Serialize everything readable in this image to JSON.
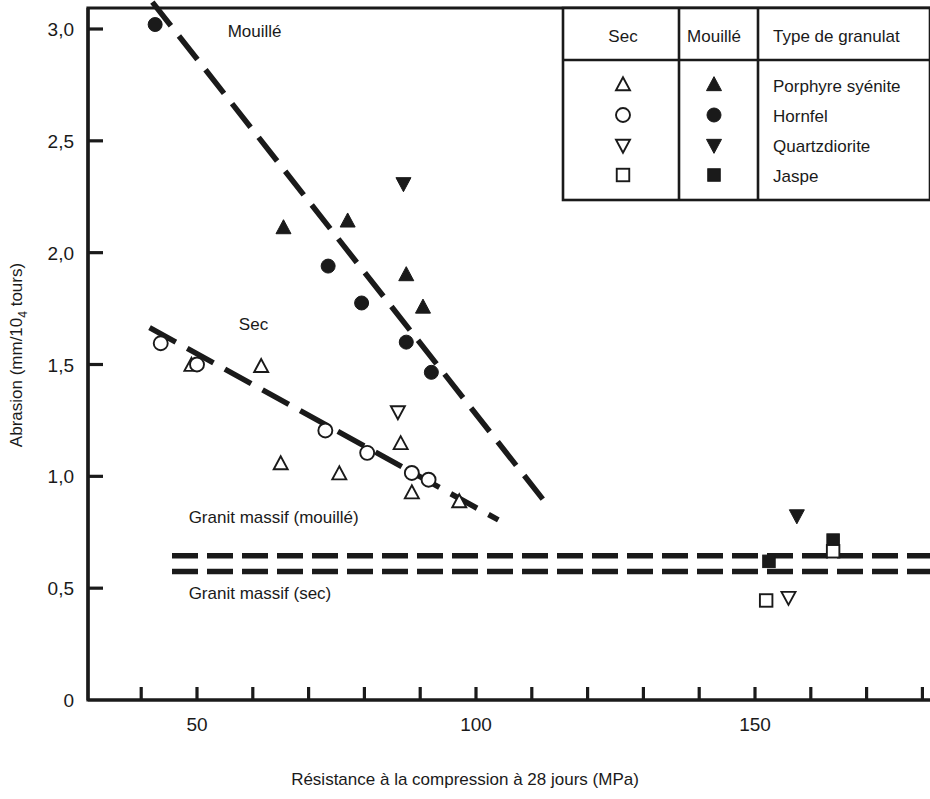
{
  "chart_data": {
    "type": "scatter",
    "title": "",
    "xlabel": "Résistance à la compression à 28 jours (MPa)",
    "ylabel": "Abrasion (mm/10",
    "ylabel_sub": "4",
    "ylabel_tail": " tours)",
    "xlim": [
      30,
      180
    ],
    "ylim": [
      0,
      3.15
    ],
    "x_ticks_major": [
      50,
      100,
      150
    ],
    "x_tick_labels": [
      "50",
      "100",
      "150"
    ],
    "x_ticks_minor": [
      40,
      60,
      70,
      80,
      90,
      110,
      120,
      130,
      140,
      160,
      170,
      180
    ],
    "y_ticks": [
      0,
      0.5,
      1.0,
      1.5,
      2.0,
      2.5,
      3.0
    ],
    "y_tick_labels": [
      "0",
      "0,5",
      "1,0",
      "1,5",
      "2,0",
      "2,5",
      "3,0"
    ],
    "grid": false,
    "legend_position": "top-right",
    "series": [
      {
        "name": "Porphyre syénite (mouillé)",
        "marker": "filled-triangle-up",
        "condition": "mouille",
        "points": [
          {
            "x": 65.5,
            "y": 2.11
          },
          {
            "x": 77.0,
            "y": 2.14
          },
          {
            "x": 87.5,
            "y": 1.9
          },
          {
            "x": 90.5,
            "y": 1.755
          }
        ]
      },
      {
        "name": "Hornfel (mouillé)",
        "marker": "filled-circle",
        "condition": "mouille",
        "points": [
          {
            "x": 42.5,
            "y": 3.02
          },
          {
            "x": 73.5,
            "y": 1.94
          },
          {
            "x": 79.5,
            "y": 1.775
          },
          {
            "x": 87.5,
            "y": 1.6
          },
          {
            "x": 92.0,
            "y": 1.465
          }
        ]
      },
      {
        "name": "Quartzdiorite (mouillé)",
        "marker": "filled-triangle-down",
        "condition": "mouille",
        "points": [
          {
            "x": 87.0,
            "y": 2.31
          },
          {
            "x": 157.5,
            "y": 0.825
          }
        ]
      },
      {
        "name": "Jaspe (mouillé)",
        "marker": "filled-square",
        "condition": "mouille",
        "points": [
          {
            "x": 152.5,
            "y": 0.62
          },
          {
            "x": 164.0,
            "y": 0.715
          }
        ]
      },
      {
        "name": "Porphyre syénite (sec)",
        "marker": "open-triangle-up",
        "condition": "sec",
        "points": [
          {
            "x": 49.0,
            "y": 1.495
          },
          {
            "x": 61.5,
            "y": 1.49
          },
          {
            "x": 65.0,
            "y": 1.055
          },
          {
            "x": 75.5,
            "y": 1.01
          },
          {
            "x": 86.5,
            "y": 1.145
          },
          {
            "x": 88.5,
            "y": 0.925
          },
          {
            "x": 97.0,
            "y": 0.885
          }
        ]
      },
      {
        "name": "Hornfel (sec)",
        "marker": "open-circle",
        "condition": "sec",
        "points": [
          {
            "x": 43.5,
            "y": 1.595
          },
          {
            "x": 50.0,
            "y": 1.5
          },
          {
            "x": 73.0,
            "y": 1.205
          },
          {
            "x": 80.5,
            "y": 1.105
          },
          {
            "x": 88.5,
            "y": 1.015
          },
          {
            "x": 91.5,
            "y": 0.985
          }
        ]
      },
      {
        "name": "Quartzdiorite (sec)",
        "marker": "open-triangle-down",
        "condition": "sec",
        "points": [
          {
            "x": 86.0,
            "y": 1.29
          },
          {
            "x": 156.0,
            "y": 0.46
          }
        ]
      },
      {
        "name": "Jaspe (sec)",
        "marker": "open-square",
        "condition": "sec",
        "points": [
          {
            "x": 152.0,
            "y": 0.445
          },
          {
            "x": 164.0,
            "y": 0.665
          }
        ]
      }
    ],
    "trend_lines": [
      {
        "name": "Mouillé",
        "x1": 42.0,
        "y1": 3.12,
        "x2": 113.0,
        "y2": 0.865,
        "dashed": true
      },
      {
        "name": "Sec",
        "x1": 41.5,
        "y1": 1.665,
        "x2": 104.0,
        "y2": 0.805,
        "dashed": true
      }
    ],
    "reference_lines": [
      {
        "name": "Granit massif (mouillé)",
        "y": 0.645,
        "dashed": true
      },
      {
        "name": "Granit massif (sec)",
        "y": 0.575,
        "dashed": true
      }
    ],
    "annotations": [
      {
        "name": "Mouillé",
        "text": "Mouillé",
        "x": 55.5,
        "y": 2.965
      },
      {
        "name": "Sec",
        "text": "Sec",
        "x": 57.5,
        "y": 1.655
      },
      {
        "name": "Granit massif (mouillé)",
        "text": "Granit massif (mouillé)",
        "x": 48.5,
        "y": 0.79
      },
      {
        "name": "Granit massif (sec)",
        "text": "Granit massif (sec)",
        "x": 48.5,
        "y": 0.45
      }
    ]
  },
  "legend": {
    "headers": [
      "Sec",
      "Mouillé",
      "Type de granulat"
    ],
    "rows": [
      {
        "sec_marker": "open-triangle-up",
        "mouille_marker": "filled-triangle-up",
        "label": "Porphyre syénite"
      },
      {
        "sec_marker": "open-circle",
        "mouille_marker": "filled-circle",
        "label": "Hornfel"
      },
      {
        "sec_marker": "open-triangle-down",
        "mouille_marker": "filled-triangle-down",
        "label": "Quartzdiorite"
      },
      {
        "sec_marker": "open-square",
        "mouille_marker": "filled-square",
        "label": "Jaspe"
      }
    ]
  },
  "colors": {
    "ink": "#1a1a1a",
    "background": "#ffffff"
  }
}
